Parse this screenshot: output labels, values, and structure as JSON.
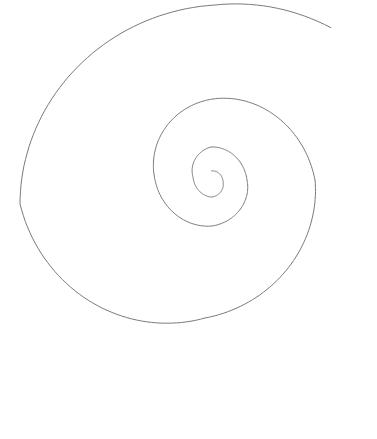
{
  "diagram": {
    "type": "logarithmic-spiral",
    "stroke_color": "#7a7a7a",
    "background_color": "#ffffff",
    "stroke_width": 1,
    "center": [
      210,
      182
    ],
    "inner_end": [
      211,
      171
    ],
    "outer_end": [
      376,
      375
    ],
    "turns_visible": 4,
    "labels": []
  }
}
